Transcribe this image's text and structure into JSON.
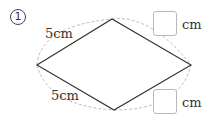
{
  "problem": {
    "number": "1",
    "shape": "rhombus",
    "labels": {
      "upper_left_side": "5cm",
      "lower_left_side": "5cm",
      "upper_right_unit": "cm",
      "lower_right_unit": "cm"
    },
    "answer_boxes": [
      {
        "position": "upper-right",
        "value": ""
      },
      {
        "position": "lower-right",
        "value": ""
      }
    ]
  },
  "colors": {
    "line": "#333333",
    "dashed_arc": "#aaaaaa",
    "box_border": "#b8b8b8"
  }
}
